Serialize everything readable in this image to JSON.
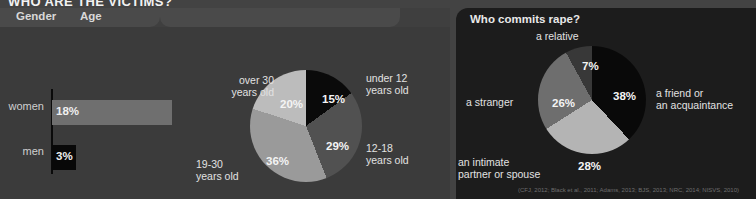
{
  "title": "WHO ARE THE VICTIMS?",
  "left_panel": {
    "tabs": [
      {
        "label": "Gender"
      },
      {
        "label": "Age"
      }
    ],
    "citation": "(RAINN, 2009; NCVS, 2013)"
  },
  "right_panel": {
    "header": "Who commits rape?",
    "citation": "(CFJ, 2012; Black et al., 2011; Adams, 2013; BJS, 2013; NRC, 2014; NISVS, 2010)"
  },
  "chart_data": [
    {
      "type": "bar",
      "title": "Gender",
      "categories": [
        "women",
        "men"
      ],
      "values": [
        18,
        3
      ],
      "value_labels": [
        "18%",
        "3%"
      ],
      "xlabel": "",
      "ylabel": "",
      "orientation": "horizontal",
      "colors": [
        "#6f6f6f",
        "#080808"
      ],
      "source": "(RAINN, 2009; NCVS, 2013)"
    },
    {
      "type": "pie",
      "title": "Age",
      "categories": [
        "under 12\nyears old",
        "12-18\nyears old",
        "19-30\nyears old",
        "over 30\nyears old"
      ],
      "values": [
        15,
        29,
        36,
        20
      ],
      "value_labels": [
        "15%",
        "29%",
        "36%",
        "20%"
      ],
      "colors": [
        "#0a0a0a",
        "#515151",
        "#9a9a9a",
        "#bcbcbc"
      ],
      "legend": "outside-labels",
      "source": "(RAINN, 2009; NCVS, 2013)"
    },
    {
      "type": "pie",
      "title": "Who commits rape?",
      "categories": [
        "a friend or\nan acquaintance",
        "an intimate\npartner or spouse",
        "a stranger",
        "a relative"
      ],
      "values": [
        38,
        28,
        26,
        7
      ],
      "value_labels": [
        "38%",
        "28%",
        "26%",
        "7%"
      ],
      "colors": [
        "#090909",
        "#b4b4b4",
        "#6e6e6e",
        "#383838"
      ],
      "legend": "outside-labels",
      "source": "(CFJ, 2012; Black et al., 2011; Adams, 2013; BJS, 2013; NRC, 2014; NISVS, 2010)"
    }
  ]
}
